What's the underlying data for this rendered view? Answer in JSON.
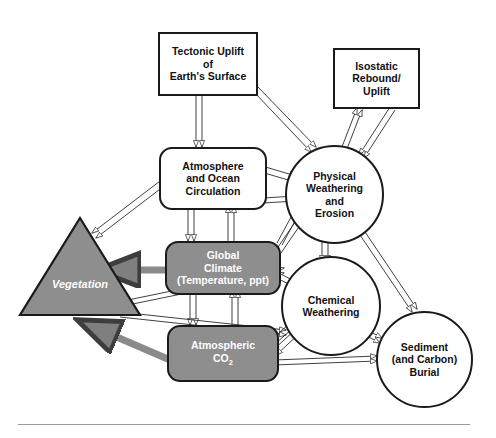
{
  "diagram": {
    "style": {
      "background": "#ffffff",
      "stroke": "#1a1a1a",
      "fill_gray": "#8e8e8e",
      "thick_arrow_gray": "#8a8a8a",
      "rule_gray": "#9a9a9a",
      "text_dark": "#111111",
      "text_light": "#ffffff"
    },
    "nodes": [
      {
        "id": "tectonic-uplift",
        "label": "Tectonic Uplift\nof\nEarth's Surface",
        "shape": "rectangle",
        "fill": "white"
      },
      {
        "id": "isostatic-rebound",
        "label": "Isostatic\nRebound/\nUplift",
        "shape": "rectangle",
        "fill": "white"
      },
      {
        "id": "atmosphere-ocean-circulation",
        "label": "Atmosphere\nand Ocean\nCirculation",
        "shape": "rounded-rectangle",
        "fill": "white"
      },
      {
        "id": "global-climate",
        "label": "Global\nClimate\n(Temperature, ppt)",
        "shape": "rounded-rectangle",
        "fill": "gray"
      },
      {
        "id": "atmospheric-co2",
        "label": "Atmospheric\nCO2",
        "label_main": "Atmospheric",
        "label_formula_base": "CO",
        "label_formula_sub": "2",
        "shape": "rounded-rectangle",
        "fill": "gray"
      },
      {
        "id": "vegetation",
        "label": "Vegetation",
        "shape": "triangle",
        "fill": "gray"
      },
      {
        "id": "physical-weathering-erosion",
        "label": "Physical\nWeathering\nand\nErosion",
        "shape": "circle",
        "fill": "white"
      },
      {
        "id": "chemical-weathering",
        "label": "Chemical\nWeathering",
        "shape": "circle",
        "fill": "white"
      },
      {
        "id": "sediment-carbon-burial",
        "label": "Sediment\n(and Carbon)\nBurial",
        "shape": "circle",
        "fill": "white"
      }
    ],
    "connections": [
      {
        "from": "tectonic-uplift",
        "to": "atmosphere-ocean-circulation",
        "style": "hollow-arrow",
        "direction": "one-way"
      },
      {
        "from": "tectonic-uplift",
        "to": "physical-weathering-erosion",
        "style": "hollow-arrow",
        "direction": "one-way"
      },
      {
        "from": "isostatic-rebound",
        "to": "physical-weathering-erosion",
        "style": "hollow-arrow",
        "direction": "two-way"
      },
      {
        "from": "atmosphere-ocean-circulation",
        "to": "global-climate",
        "style": "hollow-arrow",
        "direction": "two-way"
      },
      {
        "from": "atmosphere-ocean-circulation",
        "to": "physical-weathering-erosion",
        "style": "hollow-arrow",
        "direction": "one-way"
      },
      {
        "from": "atmosphere-ocean-circulation",
        "to": "vegetation",
        "style": "hollow-arrow",
        "direction": "one-way"
      },
      {
        "from": "global-climate",
        "to": "vegetation",
        "style": "thick-gray-arrow",
        "direction": "one-way"
      },
      {
        "from": "global-climate",
        "to": "atmospheric-co2",
        "style": "hollow-arrow",
        "direction": "two-way"
      },
      {
        "from": "global-climate",
        "to": "physical-weathering-erosion",
        "style": "hollow-arrow",
        "direction": "one-way"
      },
      {
        "from": "global-climate",
        "to": "chemical-weathering",
        "style": "hollow-arrow",
        "direction": "one-way"
      },
      {
        "from": "atmospheric-co2",
        "to": "vegetation",
        "style": "thick-gray-arrow",
        "direction": "one-way"
      },
      {
        "from": "atmospheric-co2",
        "to": "chemical-weathering",
        "style": "hollow-arrow",
        "direction": "two-way"
      },
      {
        "from": "atmospheric-co2",
        "to": "sediment-carbon-burial",
        "style": "hollow-arrow",
        "direction": "one-way"
      },
      {
        "from": "vegetation",
        "to": "chemical-weathering",
        "style": "hollow-arrow",
        "direction": "one-way"
      },
      {
        "from": "vegetation",
        "to": "atmospheric-co2",
        "style": "hollow-arrow",
        "direction": "one-way"
      },
      {
        "from": "physical-weathering-erosion",
        "to": "chemical-weathering",
        "style": "hollow-arrow",
        "direction": "one-way"
      },
      {
        "from": "physical-weathering-erosion",
        "to": "sediment-carbon-burial",
        "style": "hollow-arrow",
        "direction": "one-way"
      },
      {
        "from": "chemical-weathering",
        "to": "sediment-carbon-burial",
        "style": "hollow-arrow",
        "direction": "one-way"
      }
    ],
    "footer_rule": true
  }
}
